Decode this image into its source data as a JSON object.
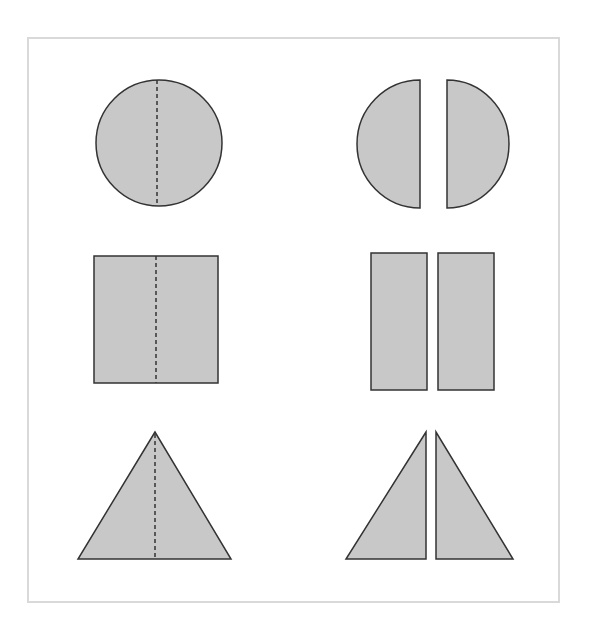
{
  "diagram": {
    "title": "",
    "colors": {
      "fill": "#c8c8c8",
      "stroke": "#333333",
      "frame": "#d9d9d9"
    },
    "rows": [
      {
        "shape": "circle",
        "left": "whole circle with dashed vertical fold line",
        "right": "circle split into two half-circles"
      },
      {
        "shape": "square",
        "left": "whole square with dashed vertical fold line",
        "right": "square split into two rectangles"
      },
      {
        "shape": "triangle",
        "left": "whole isosceles triangle with dashed vertical fold line",
        "right": "triangle split into two right triangles"
      }
    ]
  }
}
